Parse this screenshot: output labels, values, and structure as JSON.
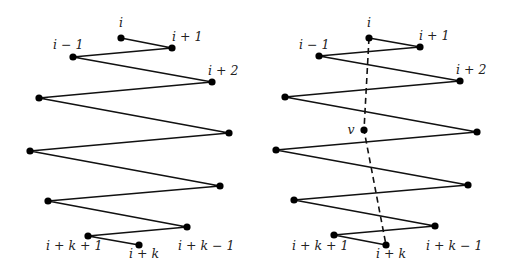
{
  "diagram": {
    "colors": {
      "line": "#111111",
      "node": "#000000",
      "label": "#222222",
      "background": "#ffffff"
    },
    "panels": [
      {
        "name": "left-panel",
        "nodes": [
          {
            "id": "i",
            "x": 121,
            "y": 38
          },
          {
            "id": "i+1",
            "x": 172,
            "y": 48
          },
          {
            "id": "i-1",
            "x": 73,
            "y": 57
          },
          {
            "id": "i+2",
            "x": 212,
            "y": 82
          },
          {
            "id": "p5",
            "x": 39,
            "y": 98
          },
          {
            "id": "p6",
            "x": 229,
            "y": 133
          },
          {
            "id": "p7",
            "x": 30,
            "y": 151
          },
          {
            "id": "p8",
            "x": 220,
            "y": 186
          },
          {
            "id": "p9",
            "x": 48,
            "y": 201
          },
          {
            "id": "i+k-1",
            "x": 187,
            "y": 227
          },
          {
            "id": "i+k+1",
            "x": 88,
            "y": 236
          },
          {
            "id": "i+k",
            "x": 139,
            "y": 245
          }
        ],
        "path": [
          "i",
          "i+1",
          "i-1",
          "i+2",
          "p5",
          "p6",
          "p7",
          "p8",
          "p9",
          "i+k-1",
          "i+k+1",
          "i+k"
        ],
        "labels": [
          {
            "text": "i",
            "x": 121,
            "y": 27,
            "anchor": "middle"
          },
          {
            "text": "i + 1",
            "x": 172,
            "y": 41,
            "anchor": "start"
          },
          {
            "text": "i − 1",
            "x": 53,
            "y": 49,
            "anchor": "start"
          },
          {
            "text": "i + 2",
            "x": 208,
            "y": 75,
            "anchor": "start"
          },
          {
            "text": "i + k + 1",
            "x": 46,
            "y": 250,
            "anchor": "start"
          },
          {
            "text": "i + k",
            "x": 129,
            "y": 258,
            "anchor": "start"
          },
          {
            "text": "i + k − 1",
            "x": 178,
            "y": 250,
            "anchor": "start"
          }
        ]
      },
      {
        "name": "right-panel",
        "nodes": [
          {
            "id": "i",
            "x": 369,
            "y": 38
          },
          {
            "id": "i+1",
            "x": 420,
            "y": 47
          },
          {
            "id": "i-1",
            "x": 319,
            "y": 56
          },
          {
            "id": "i+2",
            "x": 460,
            "y": 81
          },
          {
            "id": "p5",
            "x": 285,
            "y": 97
          },
          {
            "id": "p6",
            "x": 477,
            "y": 132
          },
          {
            "id": "p7",
            "x": 276,
            "y": 150
          },
          {
            "id": "p8",
            "x": 468,
            "y": 185
          },
          {
            "id": "p9",
            "x": 294,
            "y": 200
          },
          {
            "id": "i+k-1",
            "x": 435,
            "y": 226
          },
          {
            "id": "i+k+1",
            "x": 334,
            "y": 235
          },
          {
            "id": "i+k",
            "x": 386,
            "y": 245
          },
          {
            "id": "v",
            "x": 364,
            "y": 130
          }
        ],
        "path": [
          "i",
          "i+1",
          "i-1",
          "i+2",
          "p5",
          "p6",
          "p7",
          "p8",
          "p9",
          "i+k-1",
          "i+k+1",
          "i+k"
        ],
        "dashed": [
          "i",
          "v",
          "i+k"
        ],
        "labels": [
          {
            "text": "i",
            "x": 369,
            "y": 27,
            "anchor": "middle"
          },
          {
            "text": "i + 1",
            "x": 419,
            "y": 40,
            "anchor": "start"
          },
          {
            "text": "i − 1",
            "x": 299,
            "y": 49,
            "anchor": "start"
          },
          {
            "text": "i + 2",
            "x": 456,
            "y": 74,
            "anchor": "start"
          },
          {
            "text": "v",
            "x": 351,
            "y": 134,
            "anchor": "middle"
          },
          {
            "text": "i + k + 1",
            "x": 292,
            "y": 250,
            "anchor": "start"
          },
          {
            "text": "i + k",
            "x": 376,
            "y": 258,
            "anchor": "start"
          },
          {
            "text": "i + k − 1",
            "x": 426,
            "y": 250,
            "anchor": "start"
          }
        ]
      }
    ]
  }
}
